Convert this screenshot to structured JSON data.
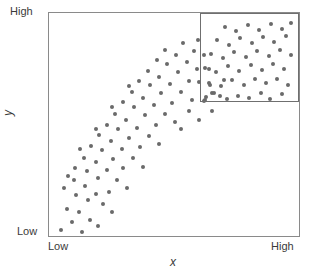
{
  "chart_data": {
    "type": "scatter",
    "title": "",
    "subtitle": "",
    "xlabel": "x",
    "ylabel": "y",
    "xlim": [
      0,
      1
    ],
    "ylim": [
      0,
      1
    ],
    "x_tick_labels": [
      "Low",
      "High"
    ],
    "y_tick_labels": [
      "Low",
      "High"
    ],
    "grid": false,
    "legend": null,
    "point_color": "#6a6a6a",
    "point_size_px": 4,
    "frame_color": "#8a8a8a",
    "background_color": "#ffffff",
    "annotations": [
      {
        "type": "rectangle",
        "name": "highlight-region",
        "x0": 0.603,
        "y0": 0.6,
        "x1": 1.0,
        "y1": 1.0,
        "stroke": "#6f6f6f",
        "fill": "none"
      }
    ],
    "n_points": 115,
    "points": [
      [
        0.048,
        0.027
      ],
      [
        0.09,
        0.065
      ],
      [
        0.13,
        0.018
      ],
      [
        0.072,
        0.12
      ],
      [
        0.118,
        0.106
      ],
      [
        0.162,
        0.071
      ],
      [
        0.196,
        0.044
      ],
      [
        0.155,
        0.16
      ],
      [
        0.108,
        0.186
      ],
      [
        0.058,
        0.215
      ],
      [
        0.1,
        0.249
      ],
      [
        0.145,
        0.222
      ],
      [
        0.188,
        0.19
      ],
      [
        0.214,
        0.142
      ],
      [
        0.25,
        0.109
      ],
      [
        0.238,
        0.196
      ],
      [
        0.196,
        0.258
      ],
      [
        0.15,
        0.292
      ],
      [
        0.102,
        0.306
      ],
      [
        0.076,
        0.27
      ],
      [
        0.14,
        0.352
      ],
      [
        0.186,
        0.33
      ],
      [
        0.232,
        0.296
      ],
      [
        0.272,
        0.252
      ],
      [
        0.31,
        0.214
      ],
      [
        0.296,
        0.305
      ],
      [
        0.254,
        0.344
      ],
      [
        0.21,
        0.386
      ],
      [
        0.168,
        0.404
      ],
      [
        0.124,
        0.388
      ],
      [
        0.2,
        0.452
      ],
      [
        0.246,
        0.424
      ],
      [
        0.292,
        0.39
      ],
      [
        0.336,
        0.352
      ],
      [
        0.376,
        0.31
      ],
      [
        0.362,
        0.398
      ],
      [
        0.318,
        0.44
      ],
      [
        0.274,
        0.478
      ],
      [
        0.23,
        0.5
      ],
      [
        0.186,
        0.478
      ],
      [
        0.264,
        0.546
      ],
      [
        0.308,
        0.52
      ],
      [
        0.352,
        0.486
      ],
      [
        0.398,
        0.45
      ],
      [
        0.44,
        0.412
      ],
      [
        0.428,
        0.5
      ],
      [
        0.384,
        0.542
      ],
      [
        0.34,
        0.58
      ],
      [
        0.296,
        0.6
      ],
      [
        0.252,
        0.578
      ],
      [
        0.33,
        0.644
      ],
      [
        0.374,
        0.618
      ],
      [
        0.418,
        0.586
      ],
      [
        0.462,
        0.548
      ],
      [
        0.504,
        0.512
      ],
      [
        0.492,
        0.598
      ],
      [
        0.448,
        0.64
      ],
      [
        0.404,
        0.676
      ],
      [
        0.36,
        0.694
      ],
      [
        0.318,
        0.672
      ],
      [
        0.396,
        0.738
      ],
      [
        0.44,
        0.714
      ],
      [
        0.484,
        0.682
      ],
      [
        0.528,
        0.646
      ],
      [
        0.57,
        0.61
      ],
      [
        0.558,
        0.694
      ],
      [
        0.514,
        0.736
      ],
      [
        0.47,
        0.77
      ],
      [
        0.43,
        0.788
      ],
      [
        0.462,
        0.836
      ],
      [
        0.506,
        0.812
      ],
      [
        0.55,
        0.782
      ],
      [
        0.592,
        0.748
      ],
      [
        0.578,
        0.828
      ],
      [
        0.536,
        0.866
      ],
      [
        0.596,
        0.88
      ],
      [
        0.62,
        0.812
      ],
      [
        0.64,
        0.748
      ],
      [
        0.6,
        0.69
      ],
      [
        0.56,
        0.56
      ],
      [
        0.528,
        0.48
      ],
      [
        0.598,
        0.52
      ],
      [
        0.65,
        0.56
      ],
      [
        0.652,
        0.64
      ],
      [
        0.618,
        0.606
      ],
      [
        0.642,
        0.676
      ],
      [
        0.684,
        0.626
      ],
      [
        0.7,
        0.7
      ],
      [
        0.628,
        0.624
      ],
      [
        0.625,
        0.612
      ],
      [
        0.66,
        0.64
      ],
      [
        0.71,
        0.614
      ],
      [
        0.756,
        0.628
      ],
      [
        0.8,
        0.618
      ],
      [
        0.846,
        0.64
      ],
      [
        0.884,
        0.616
      ],
      [
        0.932,
        0.638
      ],
      [
        0.64,
        0.686
      ],
      [
        0.686,
        0.672
      ],
      [
        0.73,
        0.7
      ],
      [
        0.778,
        0.678
      ],
      [
        0.822,
        0.704
      ],
      [
        0.866,
        0.684
      ],
      [
        0.912,
        0.706
      ],
      [
        0.956,
        0.676
      ],
      [
        0.624,
        0.752
      ],
      [
        0.668,
        0.734
      ],
      [
        0.714,
        0.762
      ],
      [
        0.76,
        0.74
      ],
      [
        0.806,
        0.768
      ],
      [
        0.85,
        0.746
      ],
      [
        0.896,
        0.772
      ],
      [
        0.94,
        0.75
      ],
      [
        0.648,
        0.816
      ],
      [
        0.694,
        0.796
      ],
      [
        0.74,
        0.824
      ],
      [
        0.786,
        0.802
      ],
      [
        0.832,
        0.83
      ],
      [
        0.878,
        0.808
      ],
      [
        0.924,
        0.834
      ],
      [
        0.966,
        0.812
      ],
      [
        0.672,
        0.878
      ],
      [
        0.718,
        0.858
      ],
      [
        0.764,
        0.886
      ],
      [
        0.81,
        0.864
      ],
      [
        0.856,
        0.892
      ],
      [
        0.9,
        0.87
      ],
      [
        0.946,
        0.896
      ],
      [
        0.702,
        0.938
      ],
      [
        0.748,
        0.918
      ],
      [
        0.794,
        0.946
      ],
      [
        0.84,
        0.924
      ],
      [
        0.886,
        0.952
      ],
      [
        0.932,
        0.93
      ],
      [
        0.968,
        0.956
      ]
    ]
  },
  "labels": {
    "y_high": "High",
    "y_low": "Low",
    "x_low": "Low",
    "x_high": "High",
    "y_title": "y",
    "x_title": "x"
  }
}
